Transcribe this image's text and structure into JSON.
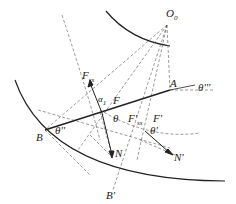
{
  "labels": {
    "O0": "O",
    "O0_sub": "0",
    "A": "A",
    "theta3": "θ'''",
    "Fss": "F",
    "Fss_sub": "ss",
    "alpha1": "α",
    "alpha1_sub": "1",
    "F": "F",
    "theta": "θ",
    "Fss_p": "F'",
    "Fss_p_sub": "ss",
    "F_p": "F'",
    "theta_p": "θ'",
    "B": "B",
    "theta2": "θ''",
    "N": "N",
    "N_p": "N'",
    "B_p": "B'"
  },
  "colors": {
    "line": "#222222",
    "dashed": "#555555",
    "background": "#ffffff"
  }
}
